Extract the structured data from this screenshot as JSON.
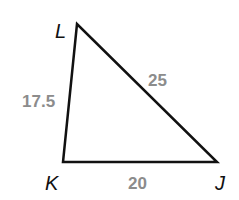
{
  "diagram": {
    "type": "triangle",
    "vertices": [
      {
        "name": "L",
        "x": 77,
        "y": 24,
        "label_x": 55,
        "label_y": 38
      },
      {
        "name": "K",
        "x": 63,
        "y": 162,
        "label_x": 45,
        "label_y": 190
      },
      {
        "name": "J",
        "x": 217,
        "y": 162,
        "label_x": 215,
        "label_y": 190
      }
    ],
    "sides": [
      {
        "between": "LK",
        "length": "17.5",
        "label_x": 22,
        "label_y": 107
      },
      {
        "between": "LJ",
        "length": "25",
        "label_x": 148,
        "label_y": 86
      },
      {
        "between": "KJ",
        "length": "20",
        "label_x": 128,
        "label_y": 189
      }
    ],
    "colors": {
      "stroke": "#111111",
      "vertex_label": "#111111",
      "side_label": "#8c8c8c"
    }
  }
}
